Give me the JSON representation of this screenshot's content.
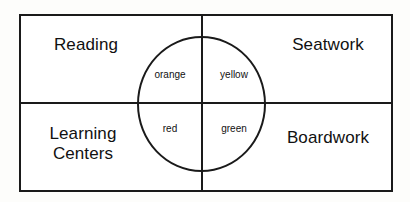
{
  "diagram": {
    "type": "classroom-rotation-quadrant",
    "background_color": "#ffffff",
    "line_color": "#1a1a1a",
    "quadrants": [
      {
        "position": "top-left",
        "label": "Reading"
      },
      {
        "position": "top-right",
        "label": "Seatwork"
      },
      {
        "position": "bottom-left",
        "label": "Learning\nCenters"
      },
      {
        "position": "bottom-right",
        "label": "Boardwork"
      }
    ],
    "center_circle": {
      "shape": "ellipse",
      "groups": [
        {
          "position": "upper-left",
          "label": "orange"
        },
        {
          "position": "upper-right",
          "label": "yellow"
        },
        {
          "position": "lower-left",
          "label": "red"
        },
        {
          "position": "lower-right",
          "label": "green"
        }
      ]
    }
  }
}
